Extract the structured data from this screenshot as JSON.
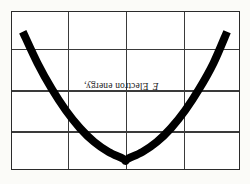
{
  "figure": {
    "background_color": "#fbfbf8",
    "frame_color": "#2b2b2b",
    "gridline_color": "#3a3a3a",
    "curve_color": "#000000",
    "axis_label_text": "Electron energy, E",
    "axis_label_prefix": "Electron energy, ",
    "axis_label_symbol": "E"
  },
  "chart_data": {
    "type": "line",
    "title": "",
    "xlabel": "",
    "ylabel": "Electron energy, E",
    "grid": true,
    "legend": null,
    "xlim": [
      0,
      4
    ],
    "ylim": [
      0,
      4
    ],
    "x_ticks": [
      0,
      1,
      2,
      3,
      4
    ],
    "y_ticks": [
      0,
      1,
      2,
      3,
      4
    ],
    "x_tick_labels": [
      "",
      "",
      "",
      "",
      ""
    ],
    "y_tick_labels": [
      "",
      "",
      "",
      "",
      ""
    ],
    "series": [
      {
        "name": "Electron energy band",
        "stroke_width_px": 8,
        "x": [
          0.19,
          0.45,
          0.7,
          0.95,
          1.2,
          1.45,
          1.7,
          1.95,
          2.0,
          2.05,
          2.3,
          2.55,
          2.8,
          3.05,
          3.3,
          3.55,
          3.79
        ],
        "y": [
          3.5,
          2.7,
          2.05,
          1.5,
          1.05,
          0.7,
          0.45,
          0.28,
          0.22,
          0.28,
          0.45,
          0.7,
          1.05,
          1.5,
          2.05,
          2.7,
          3.5
        ]
      }
    ],
    "annotations": []
  }
}
